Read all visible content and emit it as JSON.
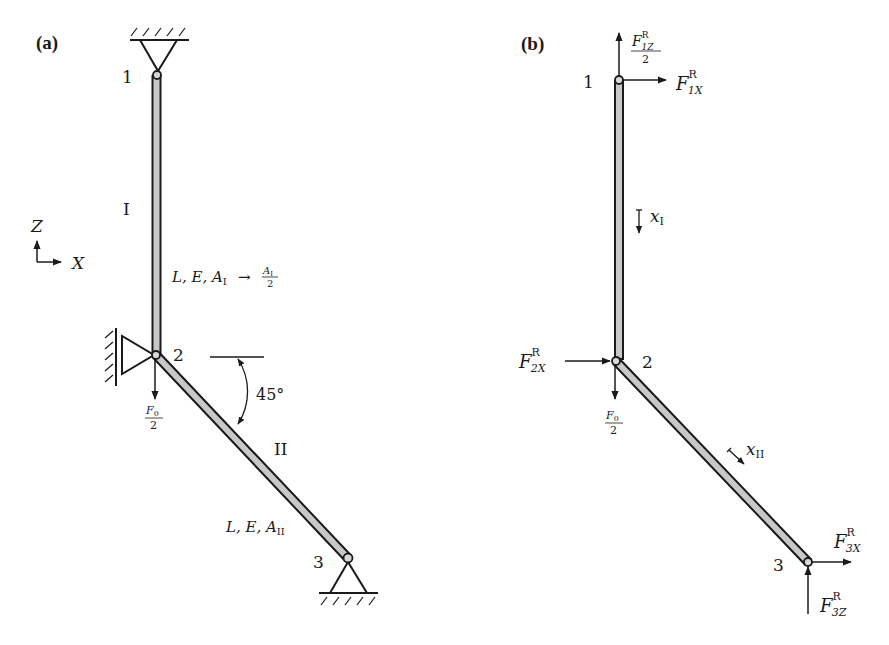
{
  "figure": {
    "panels": [
      {
        "id": "a",
        "label": "(a)",
        "nodes": [
          {
            "id": "1",
            "label": "1"
          },
          {
            "id": "2",
            "label": "2"
          },
          {
            "id": "3",
            "label": "3"
          }
        ],
        "members": [
          {
            "id": "I",
            "label": "I",
            "properties": "L, E, A",
            "properties_sub": "I",
            "modification": "→",
            "mod_num": "A",
            "mod_num_sub": "I",
            "mod_den": "2"
          },
          {
            "id": "II",
            "label": "II",
            "properties": "L, E, A",
            "properties_sub": "II"
          }
        ],
        "angle_label": "45°",
        "load": {
          "num": "F",
          "num_sub": "0",
          "den": "2"
        },
        "axes": {
          "z": "Z",
          "x": "X"
        }
      },
      {
        "id": "b",
        "label": "(b)",
        "nodes": [
          {
            "id": "1",
            "label": "1"
          },
          {
            "id": "2",
            "label": "2"
          },
          {
            "id": "3",
            "label": "3"
          }
        ],
        "reactions": {
          "f1z": {
            "base": "F",
            "sup": "R",
            "sub": "1Z",
            "den": "2"
          },
          "f1x": {
            "base": "F",
            "sup": "R",
            "sub": "1X"
          },
          "f2x": {
            "base": "F",
            "sup": "R",
            "sub": "2X"
          },
          "f3x": {
            "base": "F",
            "sup": "R",
            "sub": "3X"
          },
          "f3z": {
            "base": "F",
            "sup": "R",
            "sub": "3Z"
          }
        },
        "load": {
          "num": "F",
          "num_sub": "0",
          "den": "2"
        },
        "coords": [
          {
            "base": "x",
            "sub": "I"
          },
          {
            "base": "x",
            "sub": "II"
          }
        ]
      }
    ],
    "colors": {
      "line": "#1a1a1a",
      "bar_fill": "#c8c8c8"
    }
  }
}
